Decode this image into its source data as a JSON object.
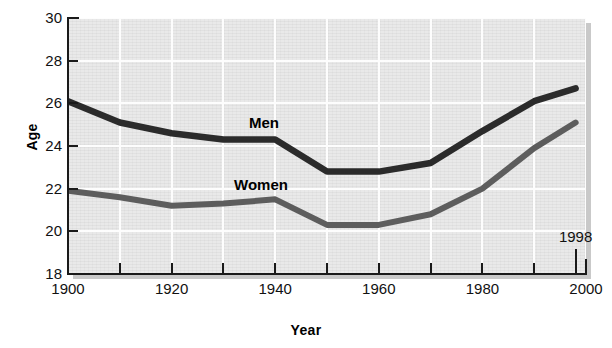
{
  "chart_data": {
    "type": "line",
    "title": "",
    "xlabel": "Year",
    "ylabel": "Age",
    "xlim": [
      1900,
      2000
    ],
    "ylim": [
      18,
      30
    ],
    "grid": true,
    "legend_position": "inline-series-labels",
    "x_ticks_major": [
      1900,
      1920,
      1940,
      1960,
      1980,
      2000
    ],
    "x_ticks_minor": [
      1910,
      1930,
      1950,
      1970,
      1990
    ],
    "x_tick_labels": [
      "1900",
      "1920",
      "1940",
      "1960",
      "1980",
      "2000"
    ],
    "y_ticks": [
      18,
      20,
      22,
      24,
      26,
      28,
      30
    ],
    "y_tick_labels": [
      "18",
      "20",
      "22",
      "24",
      "26",
      "28",
      "30"
    ],
    "annotations": [
      {
        "text": "1998",
        "x": 1998,
        "y": 18.6
      }
    ],
    "x": [
      1900,
      1910,
      1920,
      1930,
      1940,
      1950,
      1960,
      1970,
      1980,
      1990,
      1998
    ],
    "series": [
      {
        "name": "Men",
        "label": "Men",
        "color": "#2b2b2b",
        "values": [
          26.1,
          25.1,
          24.6,
          24.3,
          24.3,
          22.8,
          22.8,
          23.2,
          24.7,
          26.1,
          26.7
        ]
      },
      {
        "name": "Women",
        "label": "Women",
        "color": "#5d5d5d",
        "values": [
          21.9,
          21.6,
          21.2,
          21.3,
          21.5,
          20.3,
          20.3,
          20.8,
          22.0,
          23.9,
          25.1
        ]
      }
    ]
  },
  "axes": {
    "y_title": "Age",
    "x_title": "Year"
  },
  "colors": {
    "plot_background": "#e9e9e9",
    "gridline": "#fdfdfd",
    "axis": "#1a1a1a",
    "men_line": "#2b2b2b",
    "women_line": "#5d5d5d",
    "shadow": "#c9c9c9"
  }
}
